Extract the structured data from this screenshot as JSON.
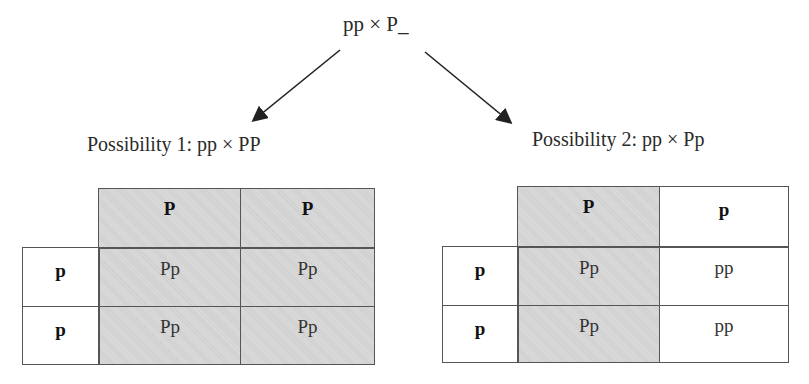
{
  "parent_cross": "pp × P_",
  "possibilities": [
    {
      "label": "Possibility 1: pp × PP",
      "col_headers": [
        "P",
        "P"
      ],
      "row_headers": [
        "p",
        "p"
      ],
      "cells": [
        [
          "Pp",
          "Pp"
        ],
        [
          "Pp",
          "Pp"
        ]
      ]
    },
    {
      "label": "Possibility 2: pp × Pp",
      "col_headers": [
        "P",
        "p"
      ],
      "row_headers": [
        "p",
        "p"
      ],
      "cells": [
        [
          "Pp",
          "pp"
        ],
        [
          "Pp",
          "pp"
        ]
      ]
    }
  ],
  "colors": {
    "shaded": "#d6d6d6",
    "border": "#555555",
    "arrow": "#222222"
  }
}
